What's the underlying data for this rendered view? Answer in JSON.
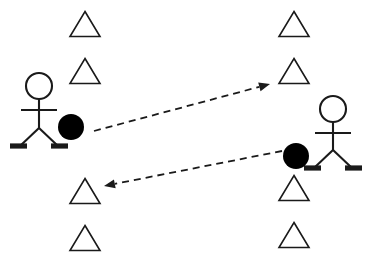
{
  "diagram": {
    "canvas": {
      "width": 370,
      "height": 271,
      "background": "#ffffff"
    },
    "colors": {
      "stroke": "#1a1a1a",
      "fill_ball": "#000000",
      "cone_fill": "#ffffff",
      "arrow": "#1a1a1a"
    },
    "figures": [
      {
        "id": "figure-left",
        "label": "left-stick-figure",
        "head": {
          "cx": 39,
          "cy": 86,
          "r": 13
        },
        "spine": {
          "x": 39,
          "y1": 99,
          "y2": 128
        },
        "arms": {
          "y": 110,
          "x1": 21,
          "x2": 57
        },
        "legs": {
          "hip_x": 39,
          "hip_y": 128,
          "left_x": 20,
          "right_x": 58,
          "foot_y": 146
        },
        "feet": [
          {
            "x1": 10,
            "x2": 27,
            "y": 146
          },
          {
            "x1": 51,
            "x2": 68,
            "y": 146
          }
        ]
      },
      {
        "id": "figure-right",
        "label": "right-stick-figure",
        "head": {
          "cx": 333,
          "cy": 109,
          "r": 13
        },
        "spine": {
          "x": 333,
          "y1": 122,
          "y2": 150
        },
        "arms": {
          "y": 133,
          "x1": 315,
          "x2": 351,
          "note": "arms"
        },
        "legs": {
          "hip_x": 333,
          "hip_y": 150,
          "left_x": 314,
          "right_x": 352,
          "foot_y": 168
        },
        "feet": [
          {
            "x1": 304,
            "x2": 321,
            "y": 168
          },
          {
            "x1": 345,
            "x2": 362,
            "y": 168
          }
        ]
      }
    ],
    "balls": [
      {
        "id": "ball-left",
        "label": "black-ball-left",
        "cx": 71,
        "cy": 127,
        "r": 13
      },
      {
        "id": "ball-right",
        "label": "black-ball-right",
        "cx": 296,
        "cy": 156,
        "r": 13
      }
    ],
    "cones": [
      {
        "id": "cone-left-1",
        "cx": 85,
        "cy": 24,
        "w": 30,
        "h": 25
      },
      {
        "id": "cone-left-2",
        "cx": 85,
        "cy": 71,
        "w": 30,
        "h": 25
      },
      {
        "id": "cone-left-3",
        "cx": 85,
        "cy": 191,
        "w": 30,
        "h": 25
      },
      {
        "id": "cone-left-4",
        "cx": 85,
        "cy": 238,
        "w": 30,
        "h": 25
      },
      {
        "id": "cone-right-1",
        "cx": 294,
        "cy": 24,
        "w": 30,
        "h": 25
      },
      {
        "id": "cone-right-2",
        "cx": 294,
        "cy": 71,
        "w": 30,
        "h": 25
      },
      {
        "id": "cone-right-3",
        "cx": 294,
        "cy": 188,
        "w": 30,
        "h": 25
      },
      {
        "id": "cone-right-4",
        "cx": 294,
        "cy": 235,
        "w": 30,
        "h": 25
      }
    ],
    "arrows": [
      {
        "id": "arrow-left-to-right",
        "label": "pass-arrow-rightward",
        "from": {
          "x": 94,
          "y": 131
        },
        "to": {
          "x": 270,
          "y": 84
        },
        "style": "dashed",
        "direction": "right"
      },
      {
        "id": "arrow-right-to-left",
        "label": "pass-arrow-leftward",
        "from": {
          "x": 282,
          "y": 151
        },
        "to": {
          "x": 104,
          "y": 186
        },
        "style": "dashed",
        "direction": "left"
      }
    ]
  }
}
